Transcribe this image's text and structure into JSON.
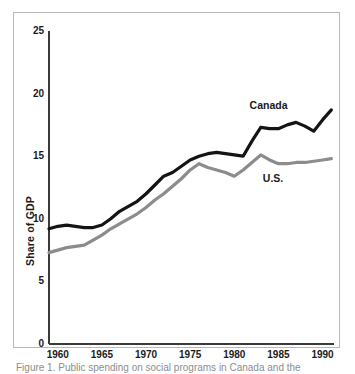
{
  "figure": {
    "background_color": "#ffffff",
    "frame_color": "#b9b9b9",
    "caption_text": "Figure 1. Public spending on social programs in Canada and the"
  },
  "chart_data": {
    "type": "line",
    "title": "",
    "xlabel": "",
    "ylabel": "Share of GDP",
    "xlim": [
      1959,
      1991.3
    ],
    "ylim": [
      0,
      25
    ],
    "grid": false,
    "legend_position": "inline-annotation",
    "axis_color": "#3a3a3a",
    "y_ticks": [
      0,
      5,
      10,
      15,
      20,
      25
    ],
    "y_tick_labels": [
      "0",
      "5",
      "10",
      "15",
      "20",
      "25"
    ],
    "x_ticks": [
      1960,
      1965,
      1970,
      1975,
      1980,
      1985,
      1990
    ],
    "x_tick_labels": [
      "1960",
      "1965",
      "1970",
      "1975",
      "1980",
      "1985",
      "1990"
    ],
    "x": [
      1959,
      1960,
      1961,
      1962,
      1963,
      1964,
      1965,
      1966,
      1967,
      1968,
      1969,
      1970,
      1971,
      1972,
      1973,
      1974,
      1975,
      1976,
      1977,
      1978,
      1979,
      1980,
      1981,
      1982,
      1983,
      1984,
      1985,
      1986,
      1987,
      1988,
      1989,
      1990,
      1991
    ],
    "series": [
      {
        "name": "Canada",
        "color": "#141414",
        "line_width": 3.2,
        "label_x": 1984.0,
        "label_y": 19.0,
        "values": [
          9.2,
          9.4,
          9.5,
          9.4,
          9.3,
          9.3,
          9.5,
          10.0,
          10.6,
          11.0,
          11.4,
          12.0,
          12.7,
          13.4,
          13.7,
          14.2,
          14.7,
          15.0,
          15.2,
          15.3,
          15.2,
          15.1,
          15.0,
          16.2,
          17.3,
          17.2,
          17.2,
          17.5,
          17.7,
          17.4,
          17.0,
          17.9,
          18.7
        ]
      },
      {
        "name": "U.S.",
        "color": "#8c8c8c",
        "line_width": 3.2,
        "label_x": 1985.5,
        "label_y": 13.2,
        "values": [
          7.3,
          7.5,
          7.7,
          7.8,
          7.9,
          8.3,
          8.7,
          9.2,
          9.6,
          10.0,
          10.4,
          10.9,
          11.5,
          12.0,
          12.6,
          13.2,
          13.9,
          14.4,
          14.1,
          13.9,
          13.7,
          13.4,
          13.9,
          14.5,
          15.1,
          14.7,
          14.4,
          14.4,
          14.5,
          14.5,
          14.6,
          14.7,
          14.8
        ]
      }
    ]
  }
}
